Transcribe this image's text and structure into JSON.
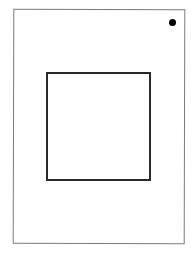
{
  "diagram": {
    "outer_frame": {
      "shape": "rectangle",
      "border_color": "#7a7a7a"
    },
    "inner_square": {
      "shape": "square",
      "border_color": "#2a2a2a"
    },
    "marker": {
      "shape": "dot",
      "position": "top-right",
      "color": "#000000"
    }
  }
}
